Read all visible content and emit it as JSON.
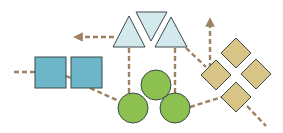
{
  "diagram": {
    "width": 283,
    "height": 133,
    "colors": {
      "background": "#ffffff",
      "square_fill": "#6db6c9",
      "triangle_fill": "#d3e9ee",
      "circle_fill": "#8cc152",
      "diamond_fill": "#d7c486",
      "stroke": "#3d4a48",
      "connector": "#9c8163"
    },
    "shape_groups": [
      {
        "name": "squares",
        "shape": "square",
        "count": 2
      },
      {
        "name": "triangles",
        "shape": "triangle",
        "count": 3
      },
      {
        "name": "circles",
        "shape": "circle",
        "count": 3
      },
      {
        "name": "diamonds",
        "shape": "diamond",
        "count": 4
      }
    ],
    "squares": [
      {
        "x": 35,
        "y": 57,
        "size": 31
      },
      {
        "x": 71,
        "y": 57,
        "size": 31
      }
    ],
    "triangles": [
      {
        "points": "129,16 145,47 113,47"
      },
      {
        "points": "136,12 167,12 151,41"
      },
      {
        "points": "171,17 187,47 155,47"
      }
    ],
    "circles": [
      {
        "cx": 156,
        "cy": 85,
        "r": 15
      },
      {
        "cx": 133,
        "cy": 108,
        "r": 15
      },
      {
        "cx": 175,
        "cy": 108,
        "r": 15
      }
    ],
    "diamonds": [
      {
        "cx": 236,
        "cy": 53,
        "h": 15
      },
      {
        "cx": 216,
        "cy": 75,
        "h": 15
      },
      {
        "cx": 256,
        "cy": 74,
        "h": 15
      },
      {
        "cx": 236,
        "cy": 97,
        "h": 15
      }
    ],
    "connectors": [
      {
        "x1": 14,
        "y1": 72,
        "x2": 35,
        "y2": 72,
        "arrow": false
      },
      {
        "x1": 66,
        "y1": 76,
        "x2": 71,
        "y2": 78,
        "arrow": false
      },
      {
        "x1": 90,
        "y1": 88,
        "x2": 119,
        "y2": 101,
        "arrow": false
      },
      {
        "x1": 114,
        "y1": 37,
        "x2": 78,
        "y2": 37,
        "arrow": true
      },
      {
        "x1": 129,
        "y1": 48,
        "x2": 129,
        "y2": 93,
        "arrow": false
      },
      {
        "x1": 175,
        "y1": 48,
        "x2": 175,
        "y2": 93,
        "arrow": false
      },
      {
        "x1": 186,
        "y1": 48,
        "x2": 206,
        "y2": 67,
        "arrow": false
      },
      {
        "x1": 210,
        "y1": 68,
        "x2": 210,
        "y2": 22,
        "arrow": true
      },
      {
        "x1": 190,
        "y1": 107,
        "x2": 222,
        "y2": 97,
        "arrow": false
      },
      {
        "x1": 247,
        "y1": 106,
        "x2": 266,
        "y2": 126,
        "arrow": false
      }
    ]
  }
}
